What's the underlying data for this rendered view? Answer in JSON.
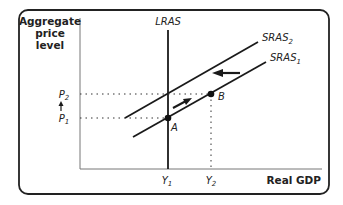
{
  "diagram": {
    "type": "aggregate-supply-shift",
    "y_axis_label": [
      "Aggregate",
      "price",
      "level"
    ],
    "x_axis_label": "Real GDP",
    "curves": {
      "lras": "LRAS",
      "sras2_base": "SRAS",
      "sras2_sub": "2",
      "sras1_base": "SRAS",
      "sras1_sub": "1"
    },
    "points": {
      "a": "A",
      "b": "B"
    },
    "y_ticks": {
      "p2_base": "P",
      "p2_sub": "2",
      "p1_base": "P",
      "p1_sub": "1"
    },
    "x_ticks": {
      "y1_base": "Y",
      "y1_sub": "1",
      "y2_base": "Y",
      "y2_sub": "2"
    },
    "colors": {
      "line": "#1a1a1a",
      "frame": "#222222",
      "axis": "#777777"
    }
  }
}
